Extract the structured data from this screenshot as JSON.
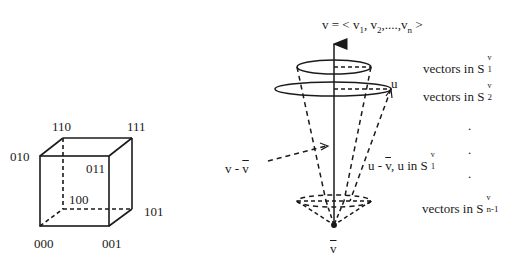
{
  "cube": {
    "vertices": {
      "v000": "000",
      "v001": "001",
      "v010": "010",
      "v011": "011",
      "v100": "100",
      "v101": "101",
      "v110": "110",
      "v111": "111"
    }
  },
  "cone": {
    "vector_label": {
      "prefix": "v = < v",
      "s1": "1",
      "mid1": ",  v",
      "s2": "2",
      "mid2": ",....,v",
      "sn": "n",
      "suffix": " >"
    },
    "u_label": "u",
    "v_minus_vbar": {
      "text": "v - ",
      "bar": "v"
    },
    "vbar_label": "v",
    "u_minus_vbar": {
      "prefix": "u - ",
      "bar": "v",
      "suffix": ", u in S",
      "sup": "v",
      "sub": "1"
    },
    "level_labels": [
      {
        "text": "vectors in S",
        "sup": "v",
        "sub": "1"
      },
      {
        "text": "vectors in S",
        "sup": "v",
        "sub": "2"
      },
      {
        "text": "vectors in S",
        "sup": "v",
        "sub": "n-1"
      }
    ],
    "ellipsis_dots": [
      ".",
      ".",
      "."
    ]
  }
}
